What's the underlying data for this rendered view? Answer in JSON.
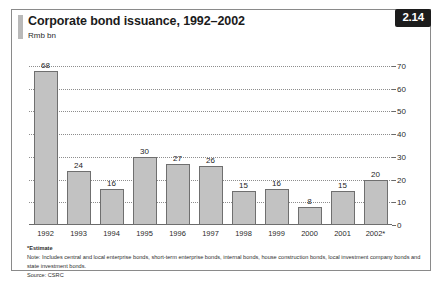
{
  "figure": {
    "title": "Corporate bond issuance, 1992–2002",
    "subtitle": "Rmb bn",
    "badge": "2.14"
  },
  "footnotes": {
    "estimate": "*Estimate",
    "note": "Note: Includes central and local enterprise bonds, short-term enterprise bonds, internal bonds, house construction bonds, local investment company bonds and state investment bonds.",
    "source": "Source: CSRC"
  },
  "colors": {
    "bar_fill": "#c2c2c2",
    "bar_stroke": "#6f6f6f",
    "badge_bg": "#1c1c1c",
    "grid": "#8d8d8d",
    "frame": "#8a8a8a"
  },
  "chart_data": {
    "type": "bar",
    "title": "Corporate bond issuance, 1992–2002",
    "subtitle": "Rmb bn",
    "xlabel": "",
    "ylabel": "Rmb bn",
    "ylim": [
      0,
      70
    ],
    "yticks": [
      0,
      10,
      20,
      30,
      40,
      50,
      60,
      70
    ],
    "y_axis_position": "right",
    "grid": true,
    "grid_style": "dotted-horizontal",
    "legend": "none",
    "categories": [
      "1992",
      "1993",
      "1994",
      "1995",
      "1996",
      "1997",
      "1998",
      "1999",
      "2000",
      "2001",
      "2002*"
    ],
    "values": [
      68,
      24,
      16,
      30,
      27,
      26,
      15,
      16,
      8,
      15,
      20
    ],
    "data_labels": [
      "68",
      "24",
      "16",
      "30",
      "27",
      "26",
      "15",
      "16",
      "8",
      "15",
      "20"
    ]
  }
}
